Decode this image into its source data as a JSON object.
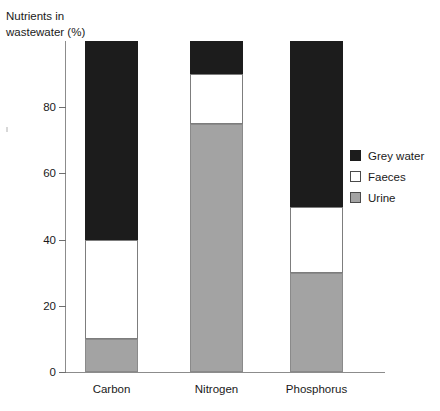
{
  "chart_data": {
    "type": "bar",
    "subtype": "stacked-100-percent",
    "title": "",
    "ylabel": "Nutrients in\nwastewater (%)",
    "xlabel": "",
    "categories": [
      "Carbon",
      "Nitrogen",
      "Phosphorus"
    ],
    "series": [
      {
        "name": "Urine",
        "color": "#a3a3a3",
        "values": [
          10,
          75,
          30
        ]
      },
      {
        "name": "Faeces",
        "color": "#ffffff",
        "values": [
          30,
          15,
          20
        ]
      },
      {
        "name": "Grey water",
        "color": "#1c1c1c",
        "values": [
          60,
          10,
          50
        ]
      }
    ],
    "stack_order_bottom_to_top": [
      "Urine",
      "Faeces",
      "Grey water"
    ],
    "segment_boundaries_percent": {
      "Carbon": {
        "urine": [
          0,
          10
        ],
        "faeces": [
          10,
          40
        ],
        "grey_water": [
          40,
          100
        ]
      },
      "Nitrogen": {
        "urine": [
          0,
          75
        ],
        "faeces": [
          75,
          90
        ],
        "grey_water": [
          90,
          100
        ]
      },
      "Phosphorus": {
        "urine": [
          0,
          30
        ],
        "faeces": [
          30,
          50
        ],
        "grey_water": [
          50,
          100
        ]
      }
    },
    "ylim": [
      0,
      100
    ],
    "yticks": [
      0,
      20,
      40,
      60,
      80
    ],
    "ytick_labels": [
      "0",
      "20",
      "40",
      "60",
      "80"
    ],
    "grid": false,
    "legend_position": "right"
  },
  "axis": {
    "y_title": "Nutrients in\nwastewater (%)",
    "ticks": [
      {
        "value": 80,
        "label": "80"
      },
      {
        "value": 60,
        "label": "60"
      },
      {
        "value": 40,
        "label": "40"
      },
      {
        "value": 20,
        "label": "20"
      },
      {
        "value": 0,
        "label": "0"
      }
    ]
  },
  "bars": [
    {
      "category": "Carbon",
      "segments": [
        {
          "series": "Grey water",
          "from": 40,
          "to": 100
        },
        {
          "series": "Faeces",
          "from": 10,
          "to": 40
        },
        {
          "series": "Urine",
          "from": 0,
          "to": 10
        }
      ]
    },
    {
      "category": "Nitrogen",
      "segments": [
        {
          "series": "Grey water",
          "from": 90,
          "to": 100
        },
        {
          "series": "Faeces",
          "from": 75,
          "to": 90
        },
        {
          "series": "Urine",
          "from": 0,
          "to": 75
        }
      ]
    },
    {
      "category": "Phosphorus",
      "segments": [
        {
          "series": "Grey water",
          "from": 50,
          "to": 100
        },
        {
          "series": "Faeces",
          "from": 30,
          "to": 50
        },
        {
          "series": "Urine",
          "from": 0,
          "to": 30
        }
      ]
    }
  ],
  "legend": {
    "items": [
      {
        "label": "Grey water",
        "color": "#1c1c1c"
      },
      {
        "label": "Faeces",
        "color": "#ffffff"
      },
      {
        "label": "Urine",
        "color": "#a3a3a3"
      }
    ]
  },
  "colors": {
    "grey_water": "#1c1c1c",
    "faeces": "#ffffff",
    "urine": "#a3a3a3",
    "axis": "#8c8c8c",
    "text": "#1a1a1a",
    "background": "#ffffff"
  }
}
